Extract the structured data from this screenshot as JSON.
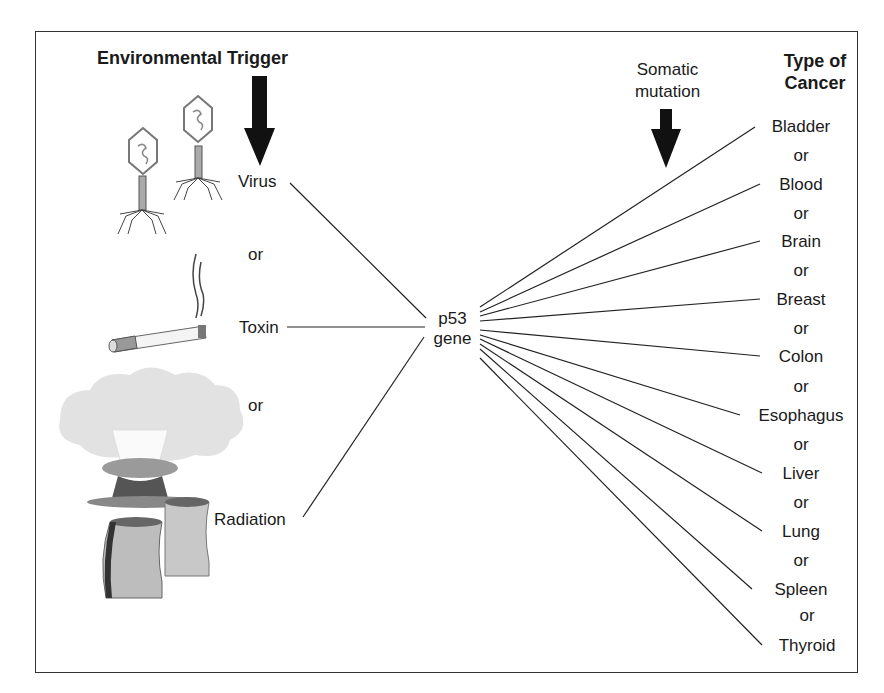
{
  "headers": {
    "environmental_trigger": "Environmental Trigger",
    "somatic_mutation_line1": "Somatic",
    "somatic_mutation_line2": "mutation",
    "type_of_cancer_line1": "Type of",
    "type_of_cancer_line2": "Cancer"
  },
  "triggers": [
    {
      "label": "Virus",
      "icon": "bacteriophage-icon"
    },
    {
      "label": "Toxin",
      "icon": "cigarette-icon"
    },
    {
      "label": "Radiation",
      "icon": "nuclear-plant-icon"
    }
  ],
  "trigger_separator": "or",
  "center": {
    "line1": "p53",
    "line2": "gene"
  },
  "cancer_separator": "or",
  "cancers": [
    "Bladder",
    "Blood",
    "Brain",
    "Breast",
    "Colon",
    "Esophagus",
    "Liver",
    "Lung",
    "Spleen",
    "Thyroid"
  ],
  "colors": {
    "line": "#222222",
    "arrow": "#111111",
    "frame": "#333333"
  }
}
